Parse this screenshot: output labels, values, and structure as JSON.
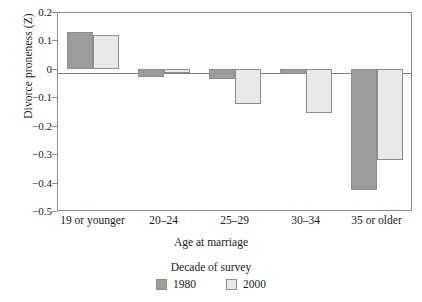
{
  "chart_data": {
    "type": "bar",
    "title": "",
    "xlabel": "Age at marriage",
    "ylabel": "Divorce proneness (Z)",
    "categories": [
      "19 or younger",
      "20–24",
      "25–29",
      "30–34",
      "35 or older"
    ],
    "series": [
      {
        "name": "1980",
        "color": "#9b9c9b",
        "values": [
          0.13,
          -0.03,
          -0.035,
          -0.017,
          -0.425
        ]
      },
      {
        "name": "2000",
        "color": "#e9e9e7",
        "values": [
          0.12,
          -0.015,
          -0.125,
          -0.155,
          -0.32
        ]
      }
    ],
    "ylim": [
      -0.5,
      0.2
    ],
    "ytick_labels": [
      "0.2",
      "0.1",
      "0",
      "−0.1",
      "−0.2",
      "−0.3",
      "−0.4",
      "−0.5"
    ],
    "ytick_values": [
      0.2,
      0.1,
      0,
      -0.1,
      -0.2,
      -0.3,
      -0.4,
      -0.5
    ],
    "grid": false,
    "zero_line": true,
    "legend": {
      "title": "Decade of survey",
      "position": "bottom",
      "entries": [
        {
          "label": "1980",
          "color": "#9b9c9b"
        },
        {
          "label": "2000",
          "color": "#e9e9e7"
        }
      ]
    }
  },
  "colors": {
    "series_1980": "#9b9c9b",
    "series_2000": "#e9e9e7",
    "axis": "#8a8a8a",
    "text": "#1a1a1a",
    "background": "#ffffff"
  }
}
